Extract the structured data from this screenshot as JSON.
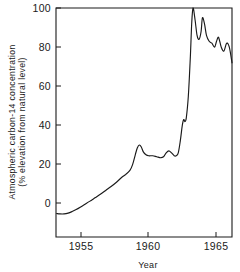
{
  "chart_data": {
    "type": "line",
    "title": "",
    "xlabel": "Year",
    "ylabel": "Atmospheric carbon-14 concentration (% elevation from natural level)",
    "ylabel_line1": "Atmospheric carbon-14  concentration",
    "ylabel_line2": "(% elevation from natural level)",
    "xlim": [
      1953.1,
      1966.2
    ],
    "ylim": [
      -17,
      100
    ],
    "xticks": [
      1955,
      1960,
      1965
    ],
    "xtick_labels": [
      "1955",
      "1960",
      "1965"
    ],
    "yticks": [
      0,
      20,
      40,
      60,
      80,
      100
    ],
    "ytick_labels": [
      "0",
      "20",
      "40",
      "60",
      "80",
      "100"
    ],
    "grid": false,
    "legend": "none",
    "series": [
      {
        "name": "Atmospheric carbon-14 concentration",
        "color": "#1a1a1a",
        "x": [
          1953.15,
          1953.4,
          1953.7,
          1954.0,
          1954.3,
          1954.6,
          1954.9,
          1955.2,
          1955.6,
          1956.0,
          1956.4,
          1956.8,
          1957.2,
          1957.6,
          1958.0,
          1958.3,
          1958.6,
          1958.8,
          1959.0,
          1959.15,
          1959.3,
          1959.45,
          1959.6,
          1959.8,
          1960.0,
          1960.3,
          1960.6,
          1960.9,
          1961.1,
          1961.3,
          1961.5,
          1961.7,
          1961.9,
          1962.05,
          1962.2,
          1962.35,
          1962.5,
          1962.6,
          1962.7,
          1962.8,
          1962.95,
          1963.1,
          1963.2,
          1963.3,
          1963.45,
          1963.6,
          1963.75,
          1963.9,
          1964.0,
          1964.15,
          1964.3,
          1964.5,
          1964.7,
          1964.9,
          1965.05,
          1965.2,
          1965.4,
          1965.6,
          1965.8,
          1966.0,
          1966.2
        ],
        "y": [
          -5.0,
          -5.2,
          -5.2,
          -4.8,
          -4.0,
          -3.0,
          -1.8,
          -0.5,
          1.2,
          3.0,
          4.8,
          6.8,
          8.8,
          11.0,
          13.5,
          15.0,
          17.0,
          20.0,
          25.0,
          28.5,
          30.0,
          29.0,
          26.5,
          25.0,
          24.5,
          24.5,
          24.0,
          23.5,
          24.0,
          26.0,
          27.0,
          26.0,
          24.5,
          24.5,
          26.0,
          32.0,
          40.0,
          43.0,
          42.0,
          44.0,
          55.0,
          75.0,
          92.0,
          100.0,
          94.0,
          86.0,
          84.0,
          88.0,
          95.0,
          92.0,
          86.0,
          83.0,
          82.0,
          80.0,
          83.0,
          85.0,
          80.0,
          78.0,
          82.0,
          80.0,
          72.0
        ]
      }
    ]
  }
}
